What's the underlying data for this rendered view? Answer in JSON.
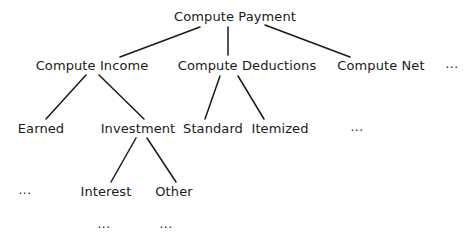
{
  "diagram": {
    "type": "hierarchy-tree",
    "root": {
      "label": "Compute Payment",
      "x": 235,
      "y": 17
    },
    "level1": [
      {
        "label": "Compute Income",
        "x": 92,
        "y": 66
      },
      {
        "label": "Compute Deductions",
        "x": 247,
        "y": 66
      },
      {
        "label": "Compute Net",
        "x": 381,
        "y": 66
      },
      {
        "label": "...",
        "x": 452,
        "y": 64
      }
    ],
    "level2": [
      {
        "label": "Earned",
        "x": 41,
        "y": 129,
        "parent": "Compute Income"
      },
      {
        "label": "Investment",
        "x": 138,
        "y": 129,
        "parent": "Compute Income"
      },
      {
        "label": "Standard",
        "x": 213,
        "y": 129,
        "parent": "Compute Deductions"
      },
      {
        "label": "Itemized",
        "x": 280,
        "y": 129,
        "parent": "Compute Deductions"
      },
      {
        "label": "...",
        "x": 357,
        "y": 127
      }
    ],
    "level3": [
      {
        "label": "...",
        "x": 25,
        "y": 190
      },
      {
        "label": "Interest",
        "x": 106,
        "y": 192,
        "parent": "Investment"
      },
      {
        "label": "Other",
        "x": 174,
        "y": 192,
        "parent": "Investment"
      }
    ],
    "level4": [
      {
        "label": "...",
        "x": 104,
        "y": 224,
        "parent": "Interest"
      },
      {
        "label": "...",
        "x": 166,
        "y": 224,
        "parent": "Other"
      }
    ],
    "edges": [
      {
        "from": "Compute Payment",
        "to": "Compute Income",
        "x1": 200,
        "y1": 27,
        "x2": 120,
        "y2": 57
      },
      {
        "from": "Compute Payment",
        "to": "Compute Deductions",
        "x1": 228,
        "y1": 27,
        "x2": 228,
        "y2": 55
      },
      {
        "from": "Compute Payment",
        "to": "Compute Net",
        "x1": 265,
        "y1": 25,
        "x2": 350,
        "y2": 57
      },
      {
        "from": "Compute Income",
        "to": "Earned",
        "x1": 86,
        "y1": 75,
        "x2": 46,
        "y2": 119
      },
      {
        "from": "Compute Income",
        "to": "Investment",
        "x1": 99,
        "y1": 75,
        "x2": 144,
        "y2": 119
      },
      {
        "from": "Compute Deductions",
        "to": "Standard",
        "x1": 220,
        "y1": 76,
        "x2": 205,
        "y2": 119
      },
      {
        "from": "Compute Deductions",
        "to": "Itemized",
        "x1": 238,
        "y1": 76,
        "x2": 264,
        "y2": 119
      },
      {
        "from": "Investment",
        "to": "Interest",
        "x1": 136,
        "y1": 138,
        "x2": 111,
        "y2": 182
      },
      {
        "from": "Investment",
        "to": "Other",
        "x1": 147,
        "y1": 138,
        "x2": 176,
        "y2": 182
      }
    ],
    "line_color": "#1a1a1a",
    "text_color": "#1a1a1a",
    "background": "#ffffff"
  }
}
